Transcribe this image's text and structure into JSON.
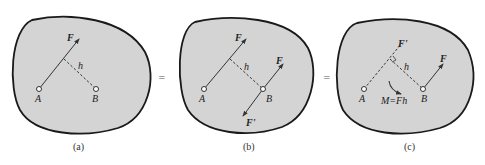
{
  "figure": {
    "panels": [
      {
        "caption": "(a)",
        "labels": {
          "force": "F",
          "distance": "h",
          "point_a": "A",
          "point_b": "B"
        }
      },
      {
        "caption": "(b)",
        "labels": {
          "force_a": "F",
          "distance": "h",
          "point_a": "A",
          "point_b": "B",
          "force_b": "F",
          "force_b_prime": "F'"
        }
      },
      {
        "caption": "(c)",
        "labels": {
          "force_ghost": "F'",
          "distance": "h",
          "point_a": "A",
          "point_b": "B",
          "force_b": "F",
          "moment": "M=Fh"
        }
      }
    ],
    "equals_sign_1": "=",
    "equals_sign_2": "=",
    "colors": {
      "body_fill": "#d4d4d4",
      "outline": "#1a1a1a",
      "line": "#333333"
    }
  }
}
